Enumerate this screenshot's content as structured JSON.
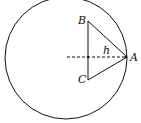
{
  "diagram": {
    "labels": {
      "A": "A",
      "B": "B",
      "C": "C",
      "h": "h"
    },
    "circle": {
      "cx": 66,
      "cy": 58,
      "r": 61
    },
    "points": {
      "A": [
        127,
        57
      ],
      "B": [
        88,
        21
      ],
      "C": [
        88,
        80
      ]
    },
    "dashed_line": {
      "from": [
        67,
        57
      ],
      "to": [
        127,
        57
      ]
    }
  }
}
